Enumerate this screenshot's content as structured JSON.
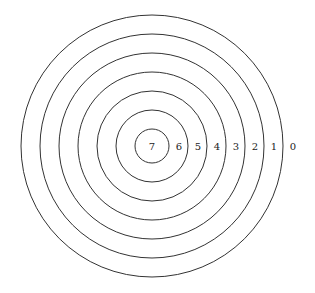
{
  "diagram": {
    "type": "concentric-circles",
    "ring_count": 7,
    "labels": [
      "7",
      "6",
      "5",
      "4",
      "3",
      "2",
      "1",
      "0"
    ],
    "stroke_color": "#333333",
    "background": "#ffffff"
  }
}
